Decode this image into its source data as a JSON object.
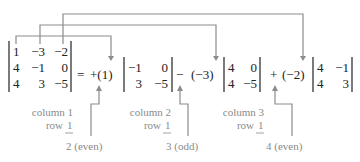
{
  "main_matrix": {
    "rows": [
      [
        "1",
        "-3",
        "-2"
      ],
      [
        "4",
        "-1",
        "0"
      ],
      [
        "4",
        "3",
        "-5"
      ]
    ]
  },
  "equals": "=",
  "terms": [
    {
      "sign": "+",
      "coef": "(1)",
      "minor": [
        [
          "-1",
          "0"
        ],
        [
          "3",
          "-5"
        ]
      ],
      "column": "column 1",
      "row_word": "row",
      "row_num": "1",
      "parity": "2 (even)"
    },
    {
      "sign": "−",
      "coef": "(−3)",
      "minor": [
        [
          "4",
          "0"
        ],
        [
          "4",
          "-5"
        ]
      ],
      "column": "column 2",
      "row_word": "row",
      "row_num": "1",
      "parity": "3 (odd)"
    },
    {
      "sign": "+",
      "coef": "(−2)",
      "minor": [
        [
          "4",
          "-1"
        ],
        [
          "4",
          "3"
        ]
      ],
      "column": "column 3",
      "row_word": "row",
      "row_num": "1",
      "parity": "4 (even)"
    }
  ],
  "display": {
    "m00": "1",
    "m01": "−3",
    "m02": "−2",
    "m10": "4",
    "m11": "−1",
    "m12": "0",
    "m20": "4",
    "m21": "3",
    "m22": "−5",
    "t0_sign_coef": "+(1)",
    "t1_sign": "−",
    "t1_coef": "(−3)",
    "t2_sign": "+",
    "t2_coef": "(−2)",
    "a00": "−1",
    "a01": "0",
    "a10": "3",
    "a11": "−5",
    "b00": "4",
    "b01": "0",
    "b10": "4",
    "b11": "−5",
    "c00": "4",
    "c01": "−1",
    "c10": "4",
    "c11": "3"
  },
  "colors": {
    "text": "#222222",
    "annotation": "#8a8a8a",
    "arrows": "#8c8c8c"
  }
}
